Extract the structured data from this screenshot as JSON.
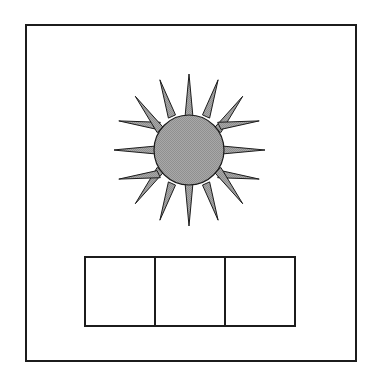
{
  "panel": {
    "name": "figure-panel",
    "title": "Non-verbal reasoning item",
    "background_color": "#ffffff",
    "frame": {
      "stroke_color": "#1c1c1c",
      "stroke_width_px": 2,
      "fill_color": "#ffffff",
      "x": 25,
      "y": 24,
      "width": 332,
      "height": 338
    }
  },
  "stimulus": {
    "name": "sun-burst-figure",
    "shape": "sun",
    "description": "Sixteen-pointed sun burst with a filled circular core",
    "ray_count": 16,
    "fill_color": "#a0a0a0",
    "stroke_color": "#1c1c1c",
    "stroke_width_px": 1,
    "center_x": 187,
    "center_y": 148,
    "core_radius": 35,
    "ray_outer_radius": 76,
    "ray_half_angle_deg": 6.5
  },
  "answers": {
    "name": "answer-boxes-row",
    "count": 3,
    "stroke_color": "#1c1c1c",
    "stroke_width_px": 2,
    "fill_color": "#ffffff",
    "x": 84,
    "y": 256,
    "width": 212,
    "height": 71,
    "cells": [
      {
        "index": 1,
        "label": "",
        "content": ""
      },
      {
        "index": 2,
        "label": "",
        "content": ""
      },
      {
        "index": 3,
        "label": "",
        "content": ""
      }
    ]
  }
}
